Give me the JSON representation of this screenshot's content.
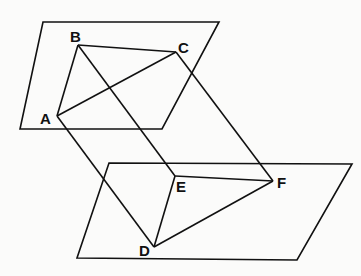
{
  "diagram": {
    "title": "",
    "planes": [
      {
        "name": "upper-plane",
        "points": [
          [
            43,
            22
          ],
          [
            219,
            22
          ],
          [
            162,
            129
          ],
          [
            20,
            129
          ]
        ]
      },
      {
        "name": "lower-plane",
        "points": [
          [
            109,
            163
          ],
          [
            352,
            164
          ],
          [
            297,
            260
          ],
          [
            77,
            258
          ]
        ]
      }
    ],
    "points": {
      "A": {
        "x": 57,
        "y": 116,
        "label": "A",
        "lx": 40,
        "ly": 124
      },
      "B": {
        "x": 78,
        "y": 45,
        "label": "B",
        "lx": 70,
        "ly": 42
      },
      "C": {
        "x": 176,
        "y": 52,
        "label": "C",
        "lx": 178,
        "ly": 53
      },
      "D": {
        "x": 154,
        "y": 247,
        "label": "D",
        "lx": 139,
        "ly": 256
      },
      "E": {
        "x": 175,
        "y": 176,
        "label": "E",
        "lx": 176,
        "ly": 192
      },
      "F": {
        "x": 273,
        "y": 181,
        "label": "F",
        "lx": 277,
        "ly": 188
      }
    },
    "segments": [
      [
        "A",
        "B"
      ],
      [
        "B",
        "C"
      ],
      [
        "A",
        "C"
      ],
      [
        "D",
        "E"
      ],
      [
        "E",
        "F"
      ],
      [
        "D",
        "F"
      ],
      [
        "A",
        "D"
      ],
      [
        "B",
        "E"
      ],
      [
        "C",
        "F"
      ]
    ]
  }
}
